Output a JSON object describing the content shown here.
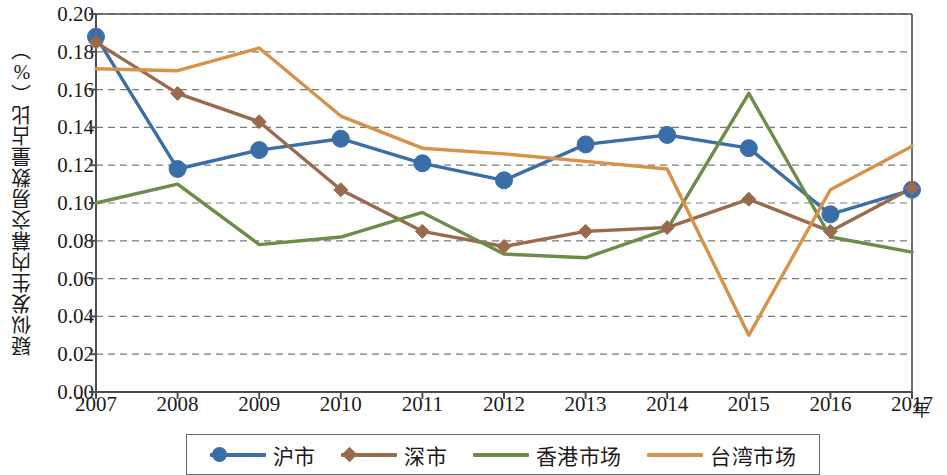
{
  "chart_data": {
    "type": "line",
    "title": "",
    "xlabel": "年",
    "ylabel": "疑似发生内幕交易数量占比（%）",
    "x": [
      "2007",
      "2008",
      "2009",
      "2010",
      "2011",
      "2012",
      "2013",
      "2014",
      "2015",
      "2016",
      "2017"
    ],
    "categories": [
      "2007",
      "2008",
      "2009",
      "2010",
      "2011",
      "2012",
      "2013",
      "2014",
      "2015",
      "2016",
      "2017"
    ],
    "ylim": [
      0.0,
      0.2
    ],
    "y_ticks": [
      "0.00",
      "0.02",
      "0.04",
      "0.06",
      "0.08",
      "0.10",
      "0.12",
      "0.14",
      "0.16",
      "0.18",
      "0.20"
    ],
    "y_tick_values": [
      0.0,
      0.02,
      0.04,
      0.06,
      0.08,
      0.1,
      0.12,
      0.14,
      0.16,
      0.18,
      0.2
    ],
    "grid": true,
    "grid_style": "dashed-horizontal",
    "legend_position": "bottom",
    "series": [
      {
        "name": "沪市",
        "color": "#3a6ea8",
        "marker": "circle",
        "values": [
          0.188,
          0.118,
          0.128,
          0.134,
          0.121,
          0.112,
          0.131,
          0.136,
          0.129,
          0.094,
          0.107
        ]
      },
      {
        "name": "深市",
        "color": "#9a6a4c",
        "marker": "diamond",
        "values": [
          0.185,
          0.158,
          0.143,
          0.107,
          0.085,
          0.077,
          0.085,
          0.087,
          0.102,
          0.085,
          0.108
        ]
      },
      {
        "name": "香港市场",
        "color": "#6d8c4a",
        "marker": "none",
        "values": [
          0.1,
          0.11,
          0.078,
          0.082,
          0.095,
          0.073,
          0.071,
          0.086,
          0.158,
          0.082,
          0.074
        ]
      },
      {
        "name": "台湾市场",
        "color": "#d89149",
        "marker": "none",
        "values": [
          0.171,
          0.17,
          0.182,
          0.146,
          0.129,
          0.126,
          0.122,
          0.118,
          0.03,
          0.107,
          0.13
        ]
      }
    ]
  },
  "axis": {
    "y_title": "疑似发生内幕交易数量占比（%）",
    "x_unit": "年"
  },
  "legend": {
    "items": [
      {
        "label": "沪市",
        "color": "#3a6ea8",
        "marker": "circle"
      },
      {
        "label": "深市",
        "color": "#9a6a4c",
        "marker": "diamond"
      },
      {
        "label": "香港市场",
        "color": "#6d8c4a",
        "marker": "none"
      },
      {
        "label": "台湾市场",
        "color": "#d89149",
        "marker": "none"
      }
    ]
  },
  "colors": {
    "axis": "#4d4d4d",
    "grid": "#7a7a7a",
    "background": "#ffffff",
    "series_blue": "#3a6ea8",
    "series_brown": "#9a6a4c",
    "series_green": "#6d8c4a",
    "series_orange": "#d89149"
  }
}
